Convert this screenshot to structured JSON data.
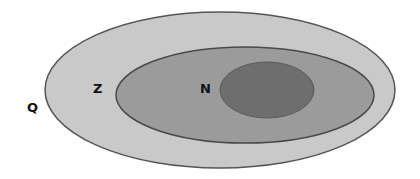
{
  "diagram": {
    "type": "nested-set-diagram",
    "sets": [
      {
        "id": "outer",
        "label": "Q",
        "fill": "#c9c9c9",
        "stroke": "#555555",
        "ellipse": {
          "cx": 220,
          "cy": 90,
          "rx": 175,
          "ry": 78
        },
        "label_pos": {
          "x": 27,
          "y": 101
        }
      },
      {
        "id": "middle",
        "label": "Z",
        "fill": "#9b9b9b",
        "stroke": "#4a4a4a",
        "ellipse": {
          "cx": 245,
          "cy": 95,
          "rx": 129,
          "ry": 48
        },
        "label_pos": {
          "x": 93,
          "y": 82
        }
      },
      {
        "id": "inner",
        "label": "N",
        "fill": "#6e6e6e",
        "stroke": "#5a5a5a",
        "ellipse": {
          "cx": 267,
          "cy": 90,
          "rx": 47,
          "ry": 28
        },
        "label_pos": {
          "x": 200,
          "y": 82
        }
      }
    ]
  }
}
